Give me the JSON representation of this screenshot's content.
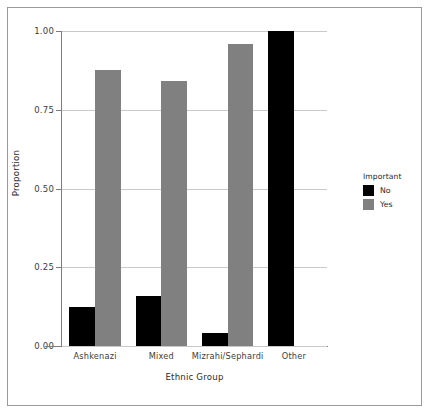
{
  "chart_data": {
    "type": "bar",
    "title": "",
    "xlabel": "Ethnic Group",
    "ylabel": "Proportion",
    "categories": [
      "Ashkenazi",
      "Mixed",
      "Mizrahi/Sephardi",
      "Other"
    ],
    "series": [
      {
        "name": "No",
        "color": "#000000",
        "values": [
          0.125,
          0.16,
          0.04,
          1.0
        ]
      },
      {
        "name": "Yes",
        "color": "#808080",
        "values": [
          0.875,
          0.84,
          0.96,
          0.0
        ]
      }
    ],
    "legend": {
      "title": "Important",
      "position": "right",
      "entries": [
        "No",
        "Yes"
      ]
    },
    "ylim": [
      0.0,
      1.0
    ],
    "yticks": [
      "0.00",
      "0.25",
      "0.50",
      "0.75",
      "1.00"
    ],
    "ytick_values": [
      0.0,
      0.25,
      0.5,
      0.75,
      1.0
    ],
    "grid": "horizontal",
    "grid_color": "#c9c9c9",
    "background": "#ffffff",
    "frame": true
  }
}
